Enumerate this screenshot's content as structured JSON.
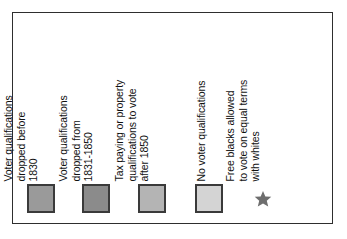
{
  "legend": {
    "title": "",
    "frame_color": "#2e2e2e",
    "background": "#ffffff",
    "entries": [
      {
        "symbol_type": "swatch",
        "symbol_name": "color-swatch-dark-gray",
        "color": "#9a9a9a",
        "border_color": "#3a3a3a",
        "label_lines": [
          "Voter qualifications",
          "dropped before",
          "1830"
        ],
        "label_full": "Voter qualifications dropped before 1830"
      },
      {
        "symbol_type": "swatch",
        "symbol_name": "color-swatch-darker-gray",
        "color": "#8b8b8b",
        "border_color": "#3a3a3a",
        "label_lines": [
          "Voter qualifications",
          "dropped from",
          "1831-1850"
        ],
        "label_full": "Voter qualifications dropped from 1831-1850"
      },
      {
        "symbol_type": "swatch",
        "symbol_name": "color-swatch-medium-gray",
        "color": "#b4b4b4",
        "border_color": "#3a3a3a",
        "label_lines": [
          "Tax paying or property",
          "qualifications to vote",
          "after 1850"
        ],
        "label_full": "Tax paying or property qualifications to vote after 1850"
      },
      {
        "symbol_type": "swatch",
        "symbol_name": "color-swatch-light-gray",
        "color": "#d4d4d4",
        "border_color": "#3a3a3a",
        "label_lines": [
          "No voter qualifications"
        ],
        "label_full": "No voter qualifications"
      },
      {
        "symbol_type": "star",
        "symbol_name": "star-icon",
        "color": "#6e6e6e",
        "border_color": "",
        "label_lines": [
          "Free blacks allowed",
          "to vote on equal terms",
          "with whites"
        ],
        "label_full": "Free blacks allowed to vote on equal terms with whites"
      }
    ]
  }
}
